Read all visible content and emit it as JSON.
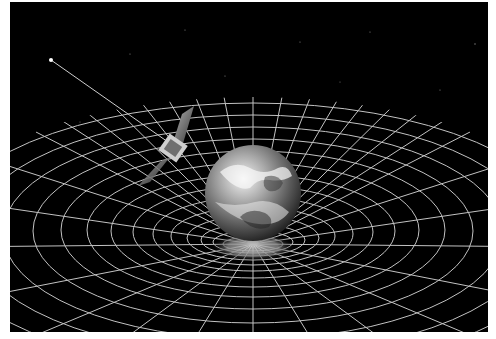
{
  "image": {
    "description": "Illustration of a satellite orbiting Earth, which sits in a funnel-shaped warped spacetime grid, against a black starfield",
    "background_color": "#000000",
    "border_color": "#ffffff",
    "grid_color": "#d8d8d8",
    "elements": {
      "earth": {
        "label": "Earth"
      },
      "satellite": {
        "label": "satellite"
      },
      "grid": {
        "label": "curved spacetime grid"
      },
      "star": {
        "label": "guide star"
      },
      "beam": {
        "label": "beam to guide star"
      }
    }
  }
}
